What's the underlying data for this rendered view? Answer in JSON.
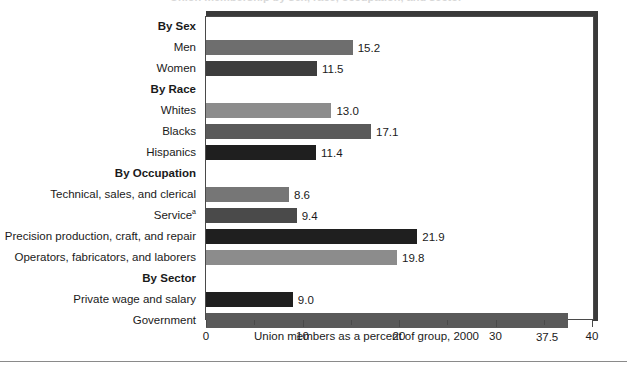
{
  "figure": {
    "clipped_title_ghost": "Union membership by sex, race, occupation, and sector",
    "x_axis_title": "Union members as a percent of group, 2000"
  },
  "colors": {
    "bar_light": "#8c8c8c",
    "bar_medium": "#6e6e6e",
    "bar_dark": "#3d3d3d",
    "bar_black": "#1f1f1f",
    "frame": "#4a4a4a",
    "shadow": "#3a3a3a",
    "text": "#1a1a1a"
  },
  "chart_data": {
    "type": "bar",
    "orientation": "horizontal",
    "title": "",
    "xlabel": "Union members as a percent of group, 2000",
    "ylabel": "",
    "xlim": [
      0,
      40
    ],
    "xticks": [
      0,
      10,
      20,
      30,
      40
    ],
    "xtick_labels": [
      "0",
      "10",
      "20",
      "30",
      "40"
    ],
    "minor_xticks": [
      5,
      15,
      25,
      35
    ],
    "grid": false,
    "legend": null,
    "footnote_marker": "a",
    "groups": [
      {
        "header": "By Sex",
        "rows": [
          {
            "label": "Men",
            "value": 15.2,
            "value_text": "15.2",
            "color": "#6e6e6e",
            "label_position": "right"
          },
          {
            "label": "Women",
            "value": 11.5,
            "value_text": "11.5",
            "color": "#3d3d3d",
            "label_position": "right"
          }
        ]
      },
      {
        "header": "By Race",
        "rows": [
          {
            "label": "Whites",
            "value": 13.0,
            "value_text": "13.0",
            "color": "#8c8c8c",
            "label_position": "right"
          },
          {
            "label": "Blacks",
            "value": 17.1,
            "value_text": "17.1",
            "color": "#5a5a5a",
            "label_position": "right"
          },
          {
            "label": "Hispanics",
            "value": 11.4,
            "value_text": "11.4",
            "color": "#1f1f1f",
            "label_position": "right"
          }
        ]
      },
      {
        "header": "By Occupation",
        "rows": [
          {
            "label": "Technical, sales, and clerical",
            "value": 8.6,
            "value_text": "8.6",
            "color": "#767676",
            "label_position": "right"
          },
          {
            "label": "Service",
            "value": 9.4,
            "value_text": "9.4",
            "color": "#4a4a4a",
            "label_position": "right",
            "superscript": "a"
          },
          {
            "label": "Precision production, craft, and repair",
            "value": 21.9,
            "value_text": "21.9",
            "color": "#1f1f1f",
            "label_position": "right"
          },
          {
            "label": "Operators, fabricators, and laborers",
            "value": 19.8,
            "value_text": "19.8",
            "color": "#8c8c8c",
            "label_position": "right"
          }
        ]
      },
      {
        "header": "By Sector",
        "rows": [
          {
            "label": "Private wage and salary",
            "value": 9.0,
            "value_text": "9.0",
            "color": "#1f1f1f",
            "label_position": "right"
          },
          {
            "label": "Government",
            "value": 37.5,
            "value_text": "37.5",
            "color": "#5a5a5a",
            "label_position": "below"
          }
        ]
      }
    ]
  }
}
